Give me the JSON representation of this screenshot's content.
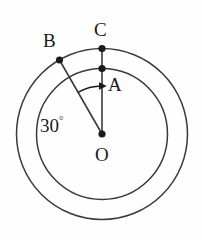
{
  "figure": {
    "type": "geometry-diagram",
    "background_color": "#fefefe",
    "stroke_color": "#3a3a3a",
    "point_color": "#1a1a1a",
    "text_color": "#1a1a1a",
    "center": {
      "label": "O",
      "x": 102,
      "y": 134
    },
    "circles": [
      {
        "name": "outer-circle",
        "cx": 102,
        "cy": 134,
        "r": 85.5
      },
      {
        "name": "inner-circle",
        "cx": 102,
        "cy": 134,
        "r": 65.5
      }
    ],
    "points": [
      {
        "label": "A",
        "x": 102,
        "y": 68.5,
        "on": "inner-circle"
      },
      {
        "label": "B",
        "x": 59.5,
        "y": 60.0,
        "on": "outer-circle"
      },
      {
        "label": "C",
        "x": 102,
        "y": 48.5,
        "on": "outer-circle"
      },
      {
        "label": "O",
        "x": 102,
        "y": 134,
        "on": "center"
      }
    ],
    "segments": [
      {
        "name": "segment-OC",
        "from": "O",
        "to": "C"
      },
      {
        "name": "segment-OB",
        "from": "O",
        "to": "B"
      }
    ],
    "angle": {
      "label": "30",
      "degree_symbol": "°",
      "value": 30,
      "unit": "degrees",
      "vertex": "O",
      "from_ray": "OB",
      "to_ray": "OC",
      "arc_radius": 48,
      "arrow_at": "OC"
    },
    "labels": {
      "A": "A",
      "B": "B",
      "C": "C",
      "O": "O",
      "angle_number": "30"
    }
  }
}
